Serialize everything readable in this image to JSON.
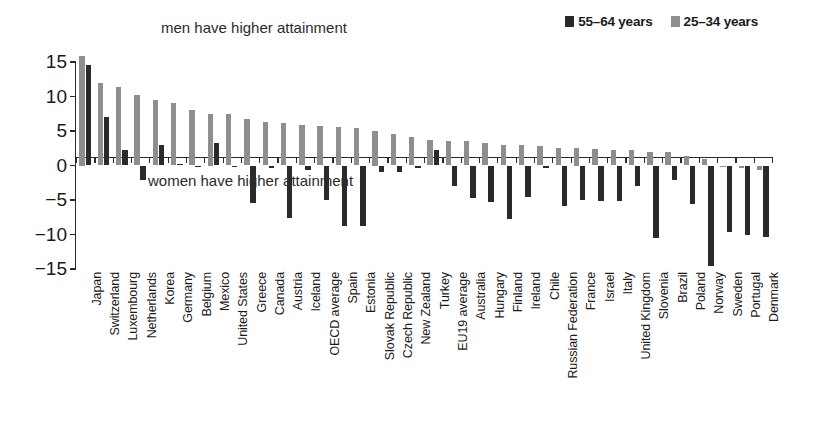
{
  "legend": {
    "items": [
      {
        "label": "55–64 years",
        "color": "#2a2a2a",
        "key": "older"
      },
      {
        "label": "25–34 years",
        "color": "#8e8e8e",
        "key": "younger"
      }
    ]
  },
  "annotations": {
    "top": "men have higher attainment",
    "bottom": "women have higher attainment"
  },
  "chart_data": {
    "type": "bar",
    "title": "",
    "subtitle": "",
    "xlabel": "",
    "ylabel": "",
    "ylim": [
      -15,
      15
    ],
    "yticks": [
      15,
      10,
      5,
      0,
      -5,
      -10,
      -15
    ],
    "ytick_labels": [
      "15",
      "10",
      "5",
      "0",
      "−5",
      "−10",
      "−15"
    ],
    "grid": false,
    "legend_position": "top-right",
    "orientation": "vertical",
    "categories": [
      "Japan",
      "Switzerland",
      "Luxembourg",
      "Netherlands",
      "Korea",
      "Germany",
      "Belgium",
      "Mexico",
      "United States",
      "Greece",
      "Canada",
      "Austria",
      "Iceland",
      "OECD average",
      "Spain",
      "Estonia",
      "Slovak Republic",
      "Czech Republic",
      "New Zealand",
      "Turkey",
      "EU19 average",
      "Australia",
      "Hungary",
      "Finland",
      "Ireland",
      "Chile",
      "Russian Federation",
      "France",
      "Israel",
      "Italy",
      "United Kingdom",
      "Slovenia",
      "Brazil",
      "Poland",
      "Norway",
      "Sweden",
      "Portugal",
      "Denmark"
    ],
    "series": [
      {
        "name": "55–64 years",
        "color": "#2a2a2a",
        "values": [
          14.5,
          7.0,
          2.3,
          -2.1,
          3.0,
          0.2,
          0.0,
          3.2,
          0.0,
          -5.5,
          -0.3,
          -7.6,
          -0.6,
          -5.0,
          -8.8,
          -8.8,
          -0.9,
          -1.0,
          -0.4,
          2.2,
          -2.9,
          -4.7,
          -5.3,
          -7.7,
          -4.6,
          -0.3,
          -5.8,
          -5.0,
          -5.2,
          -5.2,
          -3.0,
          -10.5,
          -2.1,
          -5.6,
          -14.6,
          -9.6,
          -10.1,
          -10.4
        ]
      },
      {
        "name": "25–34 years",
        "color": "#8e8e8e",
        "values": [
          15.8,
          12.0,
          11.4,
          10.2,
          9.5,
          9.0,
          8.0,
          7.5,
          7.4,
          6.7,
          6.3,
          6.2,
          5.9,
          5.7,
          5.6,
          5.4,
          5.0,
          4.6,
          4.2,
          3.7,
          3.6,
          3.5,
          3.3,
          3.0,
          2.9,
          2.8,
          2.6,
          2.5,
          2.4,
          2.3,
          2.2,
          1.9,
          2.0,
          1.4,
          0.9,
          -0.2,
          -0.3,
          -0.6
        ]
      }
    ]
  }
}
